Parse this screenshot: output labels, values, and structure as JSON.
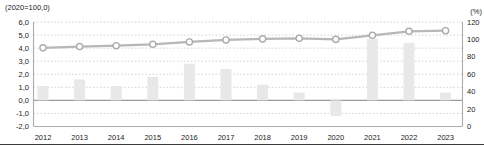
{
  "page": {
    "background": "#ffffff",
    "bottom_rule_color": "#3c3c3c"
  },
  "chart_data": {
    "type": "bar+line",
    "title": "",
    "categories": [
      "2012",
      "2013",
      "2014",
      "2015",
      "2016",
      "2017",
      "2018",
      "2019",
      "2020",
      "2021",
      "2022",
      "2023"
    ],
    "series": [
      {
        "name": "yoy-growth-bars",
        "type": "bar",
        "axis": "left",
        "color": "#e8e8e8",
        "values": [
          1.1,
          1.6,
          1.1,
          1.8,
          2.8,
          2.4,
          1.2,
          0.6,
          -1.2,
          4.7,
          4.4,
          0.6
        ]
      },
      {
        "name": "index-line",
        "type": "line",
        "axis": "right",
        "color": "#b7b7b7",
        "marker": "open-circle",
        "marker_fill": "#ffffff",
        "marker_stroke": "#acacac",
        "values": [
          90.3,
          91.8,
          92.8,
          94.4,
          97.1,
          99.4,
          100.6,
          101.2,
          100.0,
          104.7,
          109.3,
          110.0
        ]
      }
    ],
    "left_axis": {
      "title": "(2020=100,0)",
      "min": -2.0,
      "max": 6.0,
      "tick_step": 1.0,
      "tick_labels": [
        "6,0",
        "5,0",
        "4,0",
        "3,0",
        "2,0",
        "1,0",
        "0,0",
        "-1,0",
        "-2,0"
      ]
    },
    "right_axis": {
      "title": "(%)",
      "min": 0,
      "max": 120,
      "tick_step": 20,
      "tick_labels": [
        "120",
        "100",
        "80",
        "60",
        "40",
        "20",
        "0"
      ]
    },
    "grid": "horizontal-dotted",
    "grid_color": "#cccccc",
    "zero_line_color": "#9a9a9a",
    "axis_line_color": "#ababab",
    "tick_text_color": "#222222",
    "legend": "none"
  }
}
